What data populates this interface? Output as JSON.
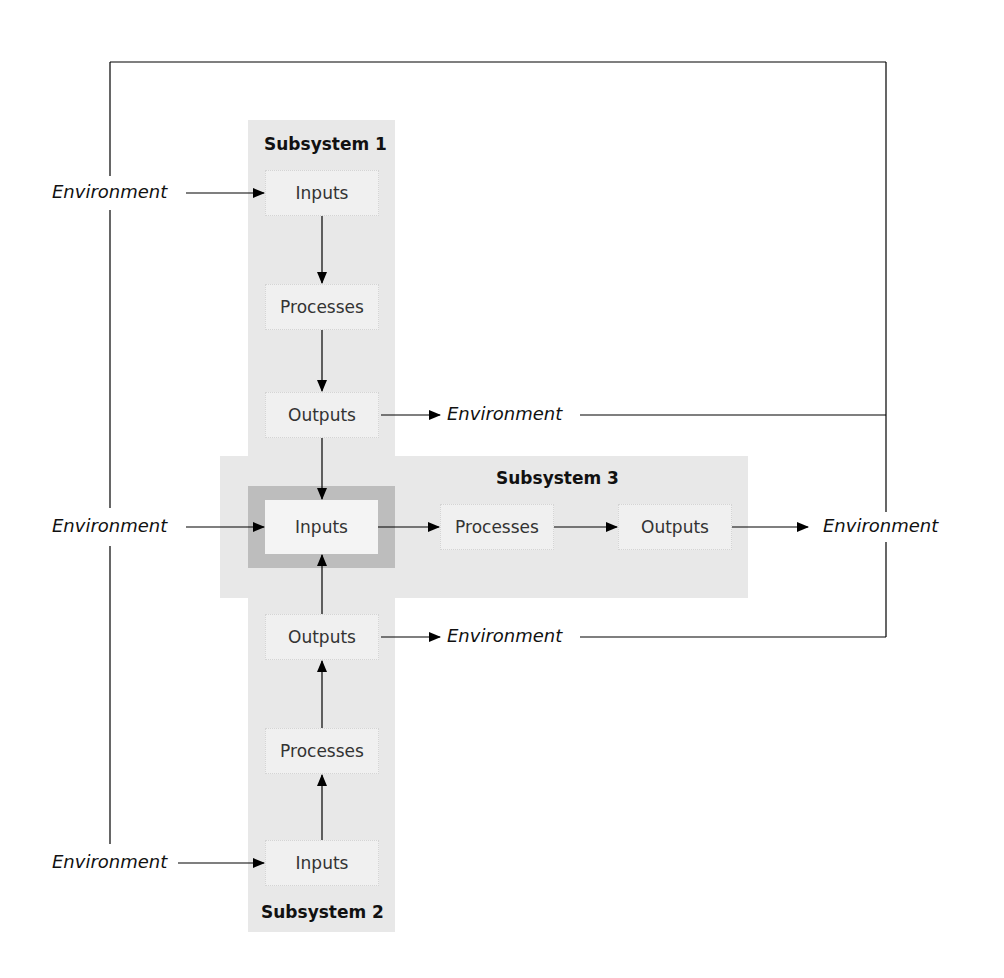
{
  "diagram": {
    "subsystems": [
      {
        "title": "Subsystem 1",
        "elements": [
          "Inputs",
          "Processes",
          "Outputs"
        ]
      },
      {
        "title": "Subsystem 2",
        "elements": [
          "Inputs",
          "Processes",
          "Outputs"
        ]
      },
      {
        "title": "Subsystem 3",
        "elements": [
          "Inputs",
          "Processes",
          "Outputs"
        ]
      }
    ],
    "environment_label": "Environment",
    "environment_labels": {
      "left_top": "Environment",
      "left_middle": "Environment",
      "left_bottom": "Environment",
      "s1_output": "Environment",
      "s2_output": "Environment",
      "s3_output": "Environment"
    },
    "colors": {
      "band": "#e8e8e8",
      "highlight": "#bdbdbd",
      "box": "#f0f0f0",
      "line": "#000000"
    }
  }
}
